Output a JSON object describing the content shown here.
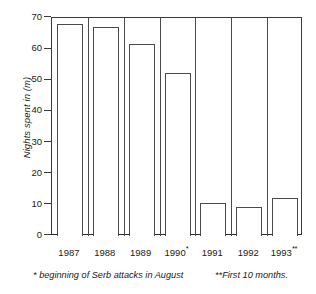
{
  "chart_data": {
    "type": "bar",
    "title": "",
    "subtitle": "",
    "xlabel": "",
    "ylabel": "Nights spent in (m)",
    "categories": [
      "1987",
      "1988",
      "1989",
      "1990",
      "1991",
      "1992",
      "1993"
    ],
    "category_labels": [
      "1987",
      "1988",
      "1989",
      "1990*",
      "1991",
      "1992",
      "1993**"
    ],
    "category_marks": [
      "",
      "",
      "",
      "*",
      "",
      "",
      "**"
    ],
    "values": [
      68,
      67,
      61.5,
      52.2,
      10.7,
      9.4,
      12.2
    ],
    "ylim": [
      0,
      70
    ],
    "yticks": [
      0,
      10,
      20,
      30,
      40,
      50,
      60,
      70
    ],
    "ytick_labels": [
      "0",
      "10",
      "20",
      "30",
      "40",
      "50",
      "60",
      "70"
    ],
    "grid": false,
    "legend": "none",
    "bar_style": {
      "fill": "#ffffff",
      "edge": "#4a4a4a"
    },
    "annotations": [
      "* beginning of Serb attacks in August",
      "**First 10 months."
    ]
  },
  "footnotes": {
    "left": "* beginning of Serb attacks in August",
    "right": "**First 10 months."
  }
}
